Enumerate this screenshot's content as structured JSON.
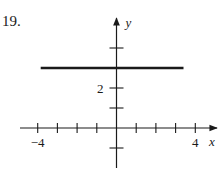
{
  "problem_number": "19.",
  "chart_data": {
    "type": "line",
    "title": "",
    "xlabel": "x",
    "ylabel": "y",
    "xlim": [
      -4.5,
      4.5
    ],
    "ylim": [
      -1.5,
      4.5
    ],
    "x_ticks": [
      -4,
      -3,
      -2,
      -1,
      1,
      2,
      3,
      4
    ],
    "x_tick_labels": {
      "-4": "−4",
      "4": "4"
    },
    "y_ticks": [
      -1,
      1,
      2,
      4
    ],
    "y_tick_labels": {
      "2": "2"
    },
    "grid": false,
    "series": [
      {
        "name": "y = 3",
        "x": [
          -3.85,
          3.4
        ],
        "y": [
          3,
          3
        ],
        "color": "#1a1a1a",
        "stroke_width": 2.5
      }
    ]
  },
  "colors": {
    "axis": "#1a1a1a",
    "background": "#ffffff"
  }
}
